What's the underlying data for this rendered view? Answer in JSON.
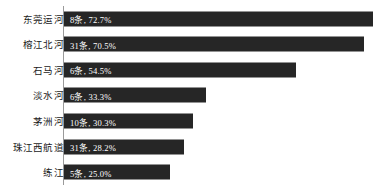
{
  "chart_data": {
    "type": "bar",
    "orientation": "horizontal",
    "title": "",
    "subtitle": "",
    "xlabel": "",
    "ylabel": "",
    "grid": false,
    "legend": null,
    "xlim": [
      0,
      80
    ],
    "axis": {
      "category_axis": "vertical-left",
      "value_axis_visible": false,
      "tick_labels": []
    },
    "colors": {
      "bar": "#262626",
      "bar_label_text": "#ffffff",
      "category_label_text": "#1a1a1a",
      "axis_line": "#9a9a9a",
      "background": "#ffffff"
    },
    "categories": [
      "东莞运河",
      "榕江北河",
      "石马河",
      "淡水河",
      "茅洲河",
      "珠江西航道",
      "练江"
    ],
    "values": [
      72.7,
      70.5,
      54.5,
      33.3,
      30.3,
      28.2,
      25.0
    ],
    "counts": [
      8,
      31,
      6,
      6,
      10,
      31,
      5
    ],
    "unit": "条",
    "data_labels": [
      "8条, 72.7%",
      "31条, 70.5%",
      "6条, 54.5%",
      "6条, 33.3%",
      "10条, 30.3%",
      "31条, 28.2%",
      "5条, 25.0%"
    ],
    "bars": [
      {
        "category": "东莞运河",
        "count": 8,
        "unit": "条",
        "percent": 72.7,
        "label": "8条, 72.7%"
      },
      {
        "category": "榕江北河",
        "count": 31,
        "unit": "条",
        "percent": 70.5,
        "label": "31条, 70.5%"
      },
      {
        "category": "石马河",
        "count": 6,
        "unit": "条",
        "percent": 54.5,
        "label": "6条, 54.5%"
      },
      {
        "category": "淡水河",
        "count": 6,
        "unit": "条",
        "percent": 33.3,
        "label": "6条, 33.3%"
      },
      {
        "category": "茅洲河",
        "count": 10,
        "unit": "条",
        "percent": 30.3,
        "label": "10条, 30.3%"
      },
      {
        "category": "珠江西航道",
        "count": 31,
        "unit": "条",
        "percent": 28.2,
        "label": "31条, 28.2%"
      },
      {
        "category": "练江",
        "count": 5,
        "unit": "条",
        "percent": 25.0,
        "label": "5条, 25.0%"
      }
    ]
  }
}
